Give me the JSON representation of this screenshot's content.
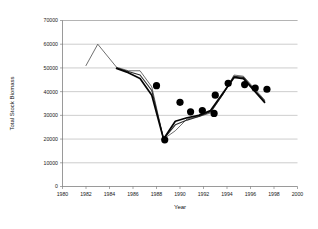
{
  "chart_data": {
    "type": "line",
    "title": "",
    "xlabel": "Year",
    "ylabel": "Total Stock Biomass",
    "xlim": [
      1980,
      2000
    ],
    "ylim": [
      0,
      70000
    ],
    "grid": true,
    "legend": "none",
    "x_ticks": [
      1980,
      1982,
      1984,
      1986,
      1988,
      1990,
      1992,
      1994,
      1996,
      1998,
      2000
    ],
    "x_tick_labels": [
      "1980",
      "1982",
      "1984",
      "1986",
      "1988",
      "1990",
      "1992",
      "1994",
      "1996",
      "1998",
      "2000"
    ],
    "y_ticks": [
      0,
      10000,
      20000,
      30000,
      40000,
      50000,
      60000,
      70000
    ],
    "y_tick_labels": [
      "0",
      "10000",
      "20000",
      "30000",
      "40000",
      "50000",
      "60000",
      "70000"
    ],
    "series": [
      {
        "name": "thin-run",
        "style": "thin",
        "x": [
          1982.0,
          1983.0,
          1984.6,
          1985.6,
          1986.6,
          1987.6,
          1988.6,
          1989.6,
          1990.6,
          1991.6,
          1992.6,
          1993.6,
          1994.6,
          1995.4,
          1996.3,
          1997.2
        ],
        "values": [
          51000,
          60000,
          50300,
          48800,
          48800,
          42000,
          20000,
          23500,
          28500,
          29500,
          31000,
          38500,
          47000,
          46500,
          41500,
          36500
        ]
      },
      {
        "name": "mid-run",
        "style": "mid",
        "x": [
          1984.6,
          1985.6,
          1986.6,
          1987.6,
          1988.6,
          1989.6,
          1990.6,
          1991.6,
          1992.6,
          1993.6,
          1994.6,
          1995.4,
          1996.3,
          1997.2
        ],
        "values": [
          50000,
          48500,
          47000,
          40500,
          20000,
          26000,
          28000,
          29500,
          31500,
          38500,
          46500,
          46000,
          41000,
          36000
        ]
      },
      {
        "name": "thick-run",
        "style": "thick",
        "x": [
          1984.6,
          1985.6,
          1986.6,
          1987.6,
          1988.6,
          1989.6,
          1990.6,
          1991.6,
          1992.6,
          1993.6,
          1994.6,
          1995.4,
          1996.3,
          1997.2
        ],
        "values": [
          49800,
          48000,
          45500,
          38500,
          20000,
          27500,
          29000,
          30000,
          32000,
          39000,
          46000,
          45500,
          40500,
          35500
        ]
      }
    ],
    "markers": [
      {
        "x": 1988.0,
        "y": 42500
      },
      {
        "x": 1988.7,
        "y": 19700
      },
      {
        "x": 1990.0,
        "y": 35500
      },
      {
        "x": 1990.9,
        "y": 31500
      },
      {
        "x": 1991.9,
        "y": 32000
      },
      {
        "x": 1992.9,
        "y": 30800
      },
      {
        "x": 1993.0,
        "y": 38500
      },
      {
        "x": 1994.1,
        "y": 43500
      },
      {
        "x": 1995.5,
        "y": 43000
      },
      {
        "x": 1996.4,
        "y": 41500
      },
      {
        "x": 1997.4,
        "y": 41000
      }
    ]
  }
}
